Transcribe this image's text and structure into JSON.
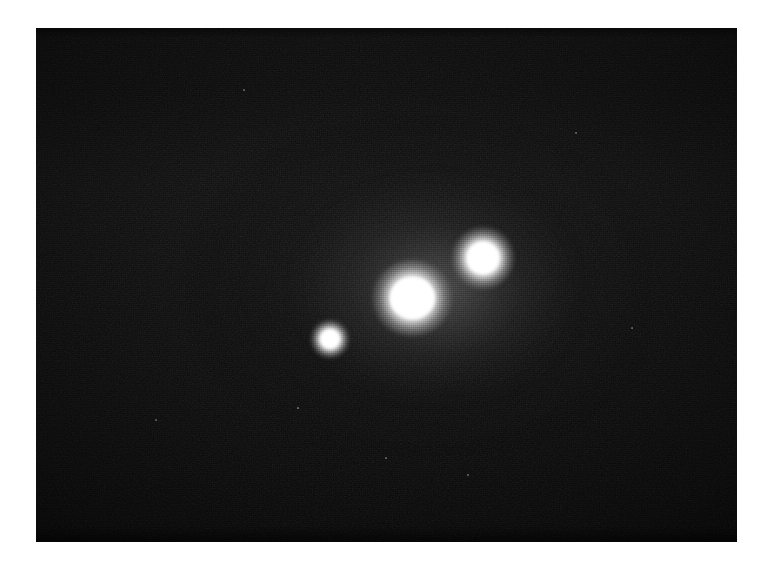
{
  "figure": {
    "kind": "astronomical-image",
    "medium": "grayscale photographic plate / CCD frame",
    "caption": "",
    "page_background": "#ffffff",
    "plate": {
      "background": "#080808",
      "x": 36,
      "y": 28,
      "width": 701,
      "height": 514
    }
  },
  "chart_data": {
    "type": "scatter",
    "title": "",
    "xlabel": "",
    "ylabel": "",
    "xlim": [
      0,
      701
    ],
    "ylim": [
      0,
      514
    ],
    "grid": false,
    "legend": "none",
    "background": "#080808",
    "note": "Positions are plate-relative pixel coordinates; brightness is a normalised 0-1 peak intensity read off the grayscale.",
    "points": [
      {
        "id": "source-a",
        "label": "bright central source",
        "x": 376,
        "y": 270,
        "core_radius": 21,
        "halo_radius": 40,
        "brightness": 1.0,
        "color": "#ffffff",
        "rank": "brightest / largest"
      },
      {
        "id": "source-b",
        "label": "upper-right source",
        "x": 447,
        "y": 230,
        "core_radius": 15,
        "halo_radius": 31,
        "brightness": 0.95,
        "color": "#ffffff",
        "rank": "second brightest"
      },
      {
        "id": "source-c",
        "label": "lower-left compact source",
        "x": 294,
        "y": 311,
        "core_radius": 9,
        "halo_radius": 19,
        "brightness": 0.88,
        "color": "#ffffff",
        "rank": "faintest / smallest"
      }
    ],
    "diffuse_glow": {
      "present": true,
      "center_x": 380,
      "center_y": 255,
      "extent_x": 460,
      "extent_y": 330,
      "peak_opacity": 0.2
    },
    "specks": [
      {
        "x": 540,
        "y": 105,
        "r": 1.2
      },
      {
        "x": 596,
        "y": 300,
        "r": 1.1
      },
      {
        "x": 432,
        "y": 447,
        "r": 1.3
      },
      {
        "x": 120,
        "y": 392,
        "r": 1.0
      },
      {
        "x": 262,
        "y": 380,
        "r": 0.9
      },
      {
        "x": 350,
        "y": 430,
        "r": 1.0
      },
      {
        "x": 208,
        "y": 62,
        "r": 0.9
      }
    ]
  }
}
